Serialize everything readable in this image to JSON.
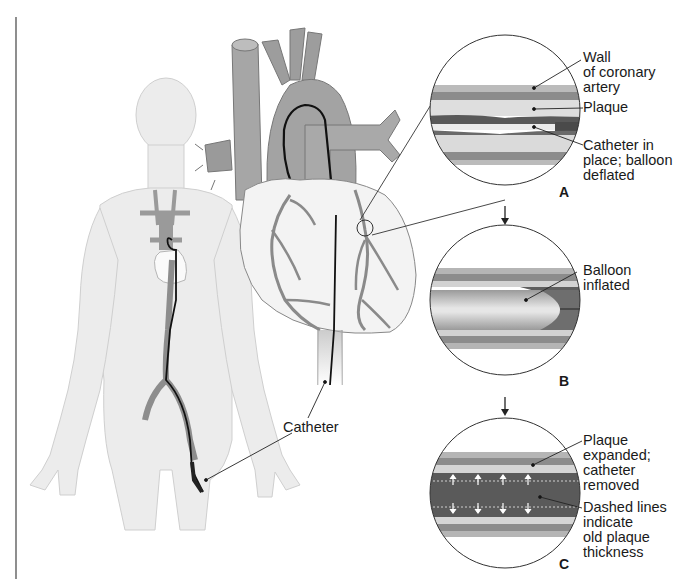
{
  "figure": {
    "colors": {
      "body_fill": "#ededed",
      "body_outline": "#c9c9c9",
      "vessel_fill": "#9a9a9a",
      "vessel_dark": "#7d7d7d",
      "heart_fill": "#f4f4f4",
      "catheter": "#111111",
      "artery_wall": "#8c8c8c",
      "plaque": "#d6d6d6",
      "lumen_dark": "#5e5e5e",
      "line": "#222222"
    }
  },
  "labels": {
    "catheter": "Catheter",
    "panel_a": {
      "letter": "A",
      "wall": "Wall\nof coronary\nartery",
      "plaque": "Plaque",
      "catheter_state": "Catheter in\nplace; balloon\ndeflated"
    },
    "panel_b": {
      "letter": "B",
      "balloon": "Balloon\ninflated"
    },
    "panel_c": {
      "letter": "C",
      "plaque_expanded": "Plaque\nexpanded;\ncatheter\nremoved",
      "dashed_lines": "Dashed lines\nindicate\nold plaque\nthickness"
    }
  },
  "arrows": [
    {
      "from": "A",
      "to": "B",
      "glyph": "down-arrow"
    },
    {
      "from": "B",
      "to": "C",
      "glyph": "down-arrow"
    }
  ]
}
